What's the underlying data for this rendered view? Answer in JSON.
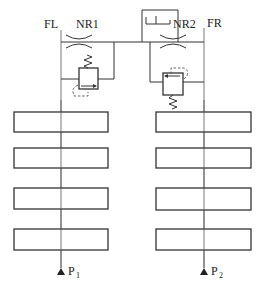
{
  "diagram": {
    "type": "hydraulic-schematic",
    "labels": {
      "left_line": "FL",
      "right_line": "FR",
      "left_throttle": "NR1",
      "right_throttle": "NR2",
      "left_pressure_base": "P",
      "left_pressure_sub": "1",
      "right_pressure_base": "P",
      "right_pressure_sub": "2"
    },
    "components": {
      "throttles": [
        "NR1",
        "NR2"
      ],
      "relief_valves": [
        "left-pressure-valve",
        "right-pressure-valve"
      ],
      "left_blocks": 4,
      "right_blocks": 4
    },
    "colors": {
      "stroke": "#333333",
      "background": "#ffffff"
    }
  }
}
